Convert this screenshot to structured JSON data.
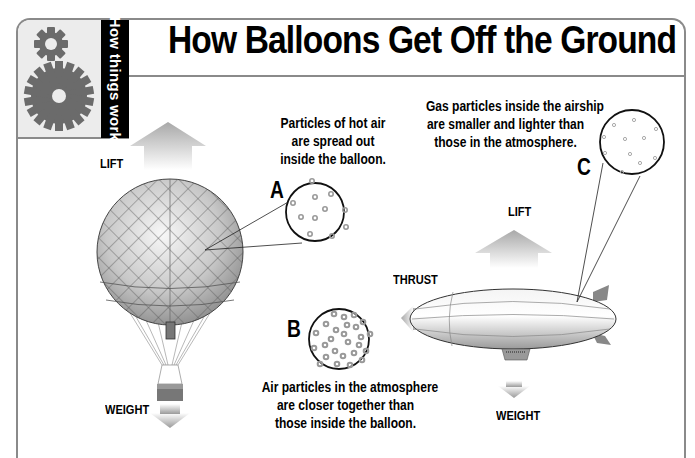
{
  "header": {
    "section_tab": "How things work",
    "title": "How Balloons Get Off the Ground",
    "icons": [
      "gear-small-icon",
      "gear-large-icon"
    ]
  },
  "hot_air_balloon": {
    "lift_label": "LIFT",
    "weight_label": "WEIGHT"
  },
  "airship": {
    "lift_label": "LIFT",
    "thrust_label": "THRUST",
    "weight_label": "WEIGHT"
  },
  "callouts": [
    {
      "letter": "A",
      "lines": [
        "Particles of hot air",
        "are spread out",
        "inside the balloon."
      ],
      "particle_density": "sparse"
    },
    {
      "letter": "B",
      "lines": [
        "Air particles in the atmosphere",
        "are closer together than",
        "those inside the balloon."
      ],
      "particle_density": "dense"
    },
    {
      "letter": "C",
      "lines": [
        "Gas particles inside the airship",
        "are smaller and lighter than",
        "those in the atmosphere."
      ],
      "particle_density": "small-sparse"
    }
  ],
  "colors": {
    "frame": "#8a8a8a",
    "tab_bg": "#000000",
    "gear": "#6b6b6b",
    "gear_panel": "#ececec",
    "arrow": "#b5b5b5"
  }
}
